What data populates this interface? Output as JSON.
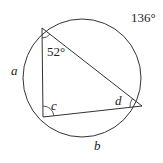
{
  "diagram": {
    "type": "inscribed-triangle-in-circle",
    "colors": {
      "stroke": "#333333",
      "text": "#222222",
      "background": "#ffffff"
    },
    "circle": {
      "cx": 82,
      "cy": 78,
      "r": 59
    },
    "vertices": {
      "top": {
        "x": 42,
        "y": 28
      },
      "bottom_left": {
        "x": 43,
        "y": 117
      },
      "right": {
        "x": 142,
        "y": 106
      }
    },
    "labels": {
      "top_angle": "52°",
      "arc_top_right": "136°",
      "arc_left": "a",
      "arc_bottom": "b",
      "angle_bottom_left": "c",
      "angle_right": "d"
    }
  }
}
